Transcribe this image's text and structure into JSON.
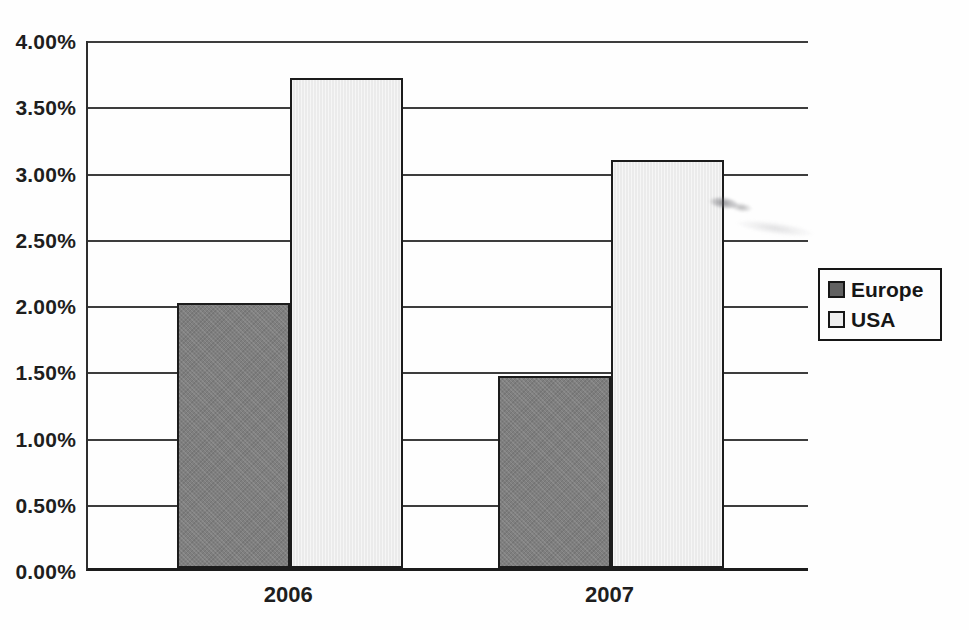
{
  "chart_data": {
    "type": "bar",
    "title": "",
    "xlabel": "",
    "ylabel": "",
    "categories": [
      "2006",
      "2007"
    ],
    "series": [
      {
        "name": "Europe",
        "color": "#7f7f7f",
        "values": [
          2.0,
          1.45
        ]
      },
      {
        "name": "USA",
        "color": "#ebebeb",
        "values": [
          3.7,
          3.08
        ]
      }
    ],
    "ylim": [
      0,
      4
    ],
    "ytick_step": 0.5,
    "ytick_labels": [
      "0.00%",
      "0.50%",
      "1.00%",
      "1.50%",
      "2.00%",
      "2.50%",
      "3.00%",
      "3.50%",
      "4.00%"
    ],
    "grid": true,
    "legend": {
      "position": "right",
      "items": [
        {
          "label": "Europe",
          "swatch_color": "#616161"
        },
        {
          "label": "USA",
          "swatch_color": "#ededed"
        }
      ]
    }
  }
}
